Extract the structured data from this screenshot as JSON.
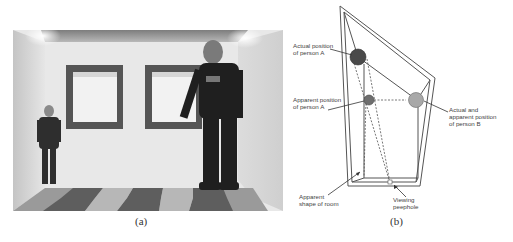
{
  "figure": {
    "panel_a": {
      "caption": "(a)",
      "description": "Photograph of Ames room: small child in left corner, tall man in right corner, two square windows on back wall, checkered floor"
    },
    "panel_b": {
      "caption": "(b)",
      "labels": {
        "actual_a": "Actual position\nof person A",
        "apparent_a": "Apparent position\nof person A",
        "actual_b": "Actual and\napparent position\nof person B",
        "room_shape": "Apparent\nshape of room",
        "peephole": "Viewing\npeephole"
      },
      "colors": {
        "person_a_actual": "#4a4a4a",
        "person_a_apparent": "#6e6e6e",
        "person_b": "#a8a8a8",
        "lines": "#555555"
      }
    }
  }
}
